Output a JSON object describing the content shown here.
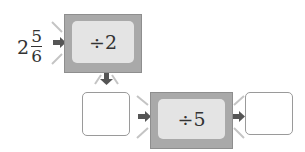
{
  "input": {
    "whole": "2",
    "numerator": "5",
    "denominator": "6"
  },
  "machines": [
    {
      "label": "÷2"
    },
    {
      "label": "÷5"
    }
  ],
  "answer_boxes": [
    {
      "value": ""
    },
    {
      "value": ""
    }
  ],
  "colors": {
    "machine_frame": "#a9a9a9",
    "machine_face": "#e4e4e4",
    "arrow": "#555555",
    "rays": "#bdbdbd"
  }
}
